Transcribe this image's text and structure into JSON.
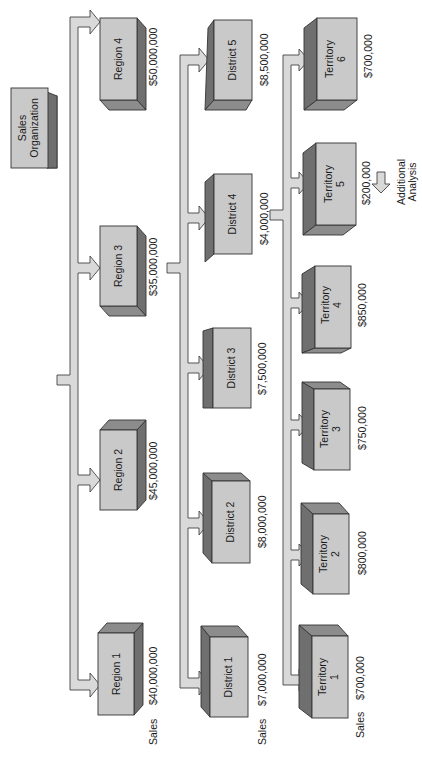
{
  "diagram": {
    "title": "Sales Organization",
    "root": {
      "label_line1": "Sales",
      "label_line2": "Organization"
    },
    "sales_label": "Sales",
    "regions": [
      {
        "label": "Region 1",
        "sales": "$40,000,000"
      },
      {
        "label": "Region 2",
        "sales": "$45,000,000"
      },
      {
        "label": "Region 3",
        "sales": "$35,000,000"
      },
      {
        "label": "Region 4",
        "sales": "$50,000,000"
      }
    ],
    "districts": [
      {
        "label": "District 1",
        "sales": "$7,000,000"
      },
      {
        "label": "District 2",
        "sales": "$8,000,000"
      },
      {
        "label": "District 3",
        "sales": "$7,500,000"
      },
      {
        "label": "District 4",
        "sales": "$4,000,000"
      },
      {
        "label": "District 5",
        "sales": "$8,500,000"
      }
    ],
    "territories": [
      {
        "label_line1": "Territory",
        "label_line2": "1",
        "sales": "$700,000"
      },
      {
        "label_line1": "Territory",
        "label_line2": "2",
        "sales": "$800,000"
      },
      {
        "label_line1": "Territory",
        "label_line2": "3",
        "sales": "$750,000"
      },
      {
        "label_line1": "Territory",
        "label_line2": "4",
        "sales": "$850,000"
      },
      {
        "label_line1": "Territory",
        "label_line2": "5",
        "sales": "$200,000"
      },
      {
        "label_line1": "Territory",
        "label_line2": "6",
        "sales": "$700,000"
      }
    ],
    "additional": {
      "line1": "Additional",
      "line2": "Analysis"
    },
    "colors": {
      "box_face": "#c8c8c8",
      "box_side": "#6e6e6e",
      "box_top": "#8a8a8a",
      "connector": "#d8d8d8",
      "stroke": "#333333"
    }
  }
}
